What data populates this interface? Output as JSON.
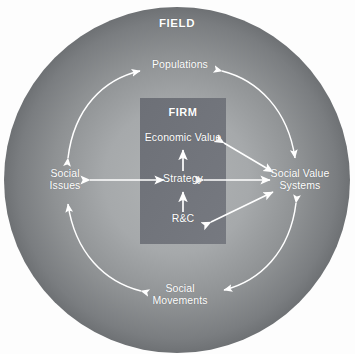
{
  "diagram": {
    "title": "FIELD",
    "background_color": "#fdfdfd",
    "outer_circle": {
      "label": "FIELD",
      "edge_color": "#6f7274",
      "center_color": "#aaadae",
      "cx": 177,
      "cy": 180,
      "r": 173
    },
    "inner_box": {
      "label": "FIRM",
      "fill_color": "#70737a",
      "x": 140,
      "y": 98,
      "width": 86,
      "height": 146
    },
    "arrow_color": "#ffffff",
    "nodes": [
      {
        "id": "field",
        "label": "FIELD",
        "x": 177,
        "y": 24,
        "kind": "title"
      },
      {
        "id": "populations",
        "label": "Populations",
        "x": 180,
        "y": 65,
        "kind": "field-node"
      },
      {
        "id": "social-issues",
        "label": "Social\nIssues",
        "x": 65,
        "y": 180,
        "kind": "field-node"
      },
      {
        "id": "social-value",
        "label": "Social Value\nSystems",
        "x": 300,
        "y": 180,
        "kind": "field-node"
      },
      {
        "id": "social-movements",
        "label": "Social\nMovements",
        "x": 180,
        "y": 295,
        "kind": "field-node"
      },
      {
        "id": "firm",
        "label": "FIRM",
        "x": 183,
        "y": 113,
        "kind": "title"
      },
      {
        "id": "economic-value",
        "label": "Economic Value",
        "x": 183,
        "y": 139,
        "kind": "firm-node"
      },
      {
        "id": "strategy",
        "label": "Strategy",
        "x": 183,
        "y": 180,
        "kind": "firm-node"
      },
      {
        "id": "rc",
        "label": "R&C",
        "x": 183,
        "y": 220,
        "kind": "firm-node"
      }
    ],
    "connections": [
      {
        "id": "rc-to-strategy",
        "from": "rc",
        "to": "strategy",
        "style": "straight",
        "heads": "one"
      },
      {
        "id": "strategy-to-economic-value",
        "from": "strategy",
        "to": "economic-value",
        "style": "straight",
        "heads": "one"
      },
      {
        "id": "social-issues-strategy",
        "from": "social-issues",
        "to": "strategy",
        "style": "straight",
        "heads": "both"
      },
      {
        "id": "strategy-social-value",
        "from": "strategy",
        "to": "social-value",
        "style": "straight",
        "heads": "both"
      },
      {
        "id": "economic-value-social-value",
        "from": "economic-value",
        "to": "social-value",
        "style": "straight",
        "heads": "both"
      },
      {
        "id": "rc-social-value",
        "from": "rc",
        "to": "social-value",
        "style": "straight",
        "heads": "both"
      },
      {
        "id": "social-issues-populations",
        "from": "social-issues",
        "to": "populations",
        "style": "curved",
        "heads": "both"
      },
      {
        "id": "populations-social-value",
        "from": "populations",
        "to": "social-value",
        "style": "curved",
        "heads": "both"
      },
      {
        "id": "social-value-social-movements",
        "from": "social-value",
        "to": "social-movements",
        "style": "curved",
        "heads": "both"
      },
      {
        "id": "social-movements-social-issues",
        "from": "social-movements",
        "to": "social-issues",
        "style": "curved",
        "heads": "both"
      }
    ]
  }
}
